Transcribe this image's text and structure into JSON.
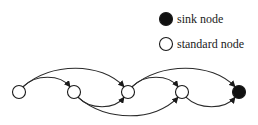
{
  "legend": {
    "items": [
      {
        "label": "sink node",
        "type": "sink",
        "fill": "#111111"
      },
      {
        "label": "standard node",
        "type": "standard",
        "fill": "#ffffff"
      }
    ]
  },
  "graph": {
    "nodes": [
      {
        "id": "n1",
        "type": "standard"
      },
      {
        "id": "n2",
        "type": "standard"
      },
      {
        "id": "n3",
        "type": "standard"
      },
      {
        "id": "n4",
        "type": "standard"
      },
      {
        "id": "n5",
        "type": "sink"
      }
    ],
    "edges": [
      {
        "from": "n1",
        "to": "n2",
        "side": "top"
      },
      {
        "from": "n1",
        "to": "n3",
        "side": "top"
      },
      {
        "from": "n2",
        "to": "n3",
        "side": "bottom"
      },
      {
        "from": "n2",
        "to": "n4",
        "side": "bottom"
      },
      {
        "from": "n3",
        "to": "n4",
        "side": "top"
      },
      {
        "from": "n3",
        "to": "n5",
        "side": "top"
      },
      {
        "from": "n4",
        "to": "n5",
        "side": "bottom"
      }
    ]
  }
}
